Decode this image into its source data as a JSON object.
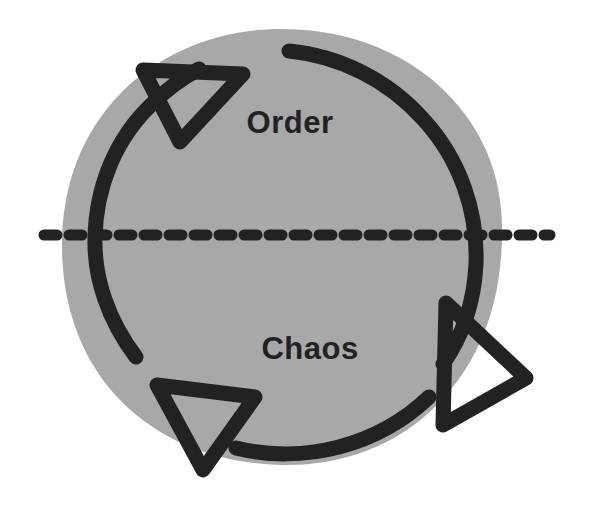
{
  "diagram": {
    "type": "cycle-diagram",
    "background_color": "#ffffff",
    "disc": {
      "name": "gray-disc",
      "fill_color": "#a8a8a8",
      "center_x": 282,
      "center_y": 247,
      "radius": 218
    },
    "stroke": {
      "color": "#222222",
      "width": 15,
      "linecap": "round",
      "linejoin": "round"
    },
    "labels": {
      "order": "Order",
      "chaos": "Chaos",
      "order_x": 290,
      "order_y": 133,
      "chaos_x": 310,
      "chaos_y": 359,
      "font_size": 31,
      "color": "#222222"
    },
    "divider": {
      "name": "horizontal-dashed-line",
      "y": 235,
      "x_start": 38,
      "x_end": 556,
      "dash_length": 13,
      "gap_length": 12,
      "thickness": 11,
      "color": "#222222"
    },
    "arrows": [
      {
        "name": "arrow-top-left",
        "direction": "up-right",
        "tip_x": 221,
        "tip_y": 60
      },
      {
        "name": "arrow-right",
        "direction": "down-right",
        "tip_x": 521,
        "tip_y": 367
      },
      {
        "name": "arrow-bottom-left",
        "direction": "down-left",
        "tip_x": 200,
        "tip_y": 472
      }
    ],
    "arcs": [
      {
        "name": "arc-left-ascending"
      },
      {
        "name": "arc-right-descending"
      },
      {
        "name": "arc-bottom"
      }
    ]
  }
}
